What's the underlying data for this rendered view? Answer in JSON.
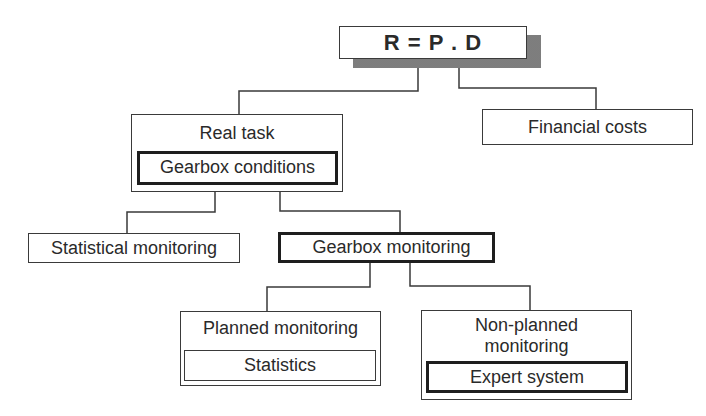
{
  "diagram": {
    "root": {
      "label": "R = P . D"
    },
    "real_task": {
      "label": "Real task",
      "inner": "Gearbox conditions"
    },
    "financial_costs": {
      "label": "Financial costs"
    },
    "statistical_monitoring": {
      "label": "Statistical monitoring"
    },
    "gearbox_monitoring": {
      "label": "Gearbox monitoring"
    },
    "planned_monitoring": {
      "label": "Planned monitoring",
      "inner": "Statistics"
    },
    "non_planned_monitoring": {
      "label_line1": "Non-planned",
      "label_line2": "monitoring",
      "inner": "Expert system"
    },
    "colors": {
      "line": "#3a3a3a",
      "shadow": "#8a8a8a",
      "background": "#ffffff"
    }
  }
}
